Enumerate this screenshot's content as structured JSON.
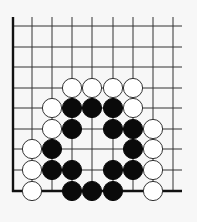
{
  "diagram": {
    "type": "go-board-corner",
    "corner": "bottom-left",
    "colors": {
      "background": "#f7f7f7",
      "line": "#333333",
      "edge": "#111111",
      "black_stone": "#0a0a0a",
      "white_stone": "#ffffff",
      "white_stone_outline": "#333333"
    },
    "grid": {
      "columns": 9,
      "rows": 9,
      "col_x": [
        13,
        32,
        52,
        72,
        92,
        113,
        133,
        153,
        173
      ],
      "row_y": [
        26,
        47,
        67,
        88,
        108,
        129,
        149,
        170,
        191
      ],
      "right_extent": 182,
      "top_extent": 17,
      "stone_radius": 9.6
    },
    "stones": [
      {
        "color": "white",
        "col": 3,
        "row": 3
      },
      {
        "color": "white",
        "col": 4,
        "row": 3
      },
      {
        "color": "white",
        "col": 5,
        "row": 3
      },
      {
        "color": "white",
        "col": 6,
        "row": 3
      },
      {
        "color": "white",
        "col": 2,
        "row": 4
      },
      {
        "color": "black",
        "col": 3,
        "row": 4
      },
      {
        "color": "black",
        "col": 4,
        "row": 4
      },
      {
        "color": "black",
        "col": 5,
        "row": 4
      },
      {
        "color": "white",
        "col": 6,
        "row": 4
      },
      {
        "color": "white",
        "col": 2,
        "row": 5
      },
      {
        "color": "black",
        "col": 3,
        "row": 5
      },
      {
        "color": "black",
        "col": 5,
        "row": 5
      },
      {
        "color": "black",
        "col": 6,
        "row": 5
      },
      {
        "color": "white",
        "col": 7,
        "row": 5
      },
      {
        "color": "white",
        "col": 1,
        "row": 6
      },
      {
        "color": "black",
        "col": 2,
        "row": 6
      },
      {
        "color": "black",
        "col": 6,
        "row": 6
      },
      {
        "color": "white",
        "col": 7,
        "row": 6
      },
      {
        "color": "white",
        "col": 1,
        "row": 7
      },
      {
        "color": "black",
        "col": 2,
        "row": 7
      },
      {
        "color": "black",
        "col": 3,
        "row": 7
      },
      {
        "color": "black",
        "col": 5,
        "row": 7
      },
      {
        "color": "black",
        "col": 6,
        "row": 7
      },
      {
        "color": "white",
        "col": 7,
        "row": 7
      },
      {
        "color": "white",
        "col": 1,
        "row": 8
      },
      {
        "color": "black",
        "col": 3,
        "row": 8
      },
      {
        "color": "black",
        "col": 4,
        "row": 8
      },
      {
        "color": "black",
        "col": 5,
        "row": 8
      },
      {
        "color": "white",
        "col": 7,
        "row": 8
      }
    ]
  }
}
